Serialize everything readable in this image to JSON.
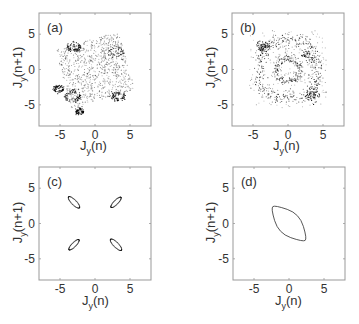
{
  "figure": {
    "xlabel_main": "J",
    "xlabel_sub": "y",
    "xlabel_arg": "(n)",
    "ylabel_main": "J",
    "ylabel_sub": "y",
    "ylabel_arg": "(n+1)",
    "tick_labels": [
      "-5",
      "0",
      "5"
    ]
  },
  "chart_data": [
    {
      "type": "scatter",
      "panel_label": "(a)",
      "title": "",
      "xlabel": "J_y(n)",
      "ylabel": "J_y(n+1)",
      "xlim": [
        -8,
        8
      ],
      "ylim": [
        -8,
        8
      ],
      "xticks": [
        -5,
        0,
        5
      ],
      "yticks": [
        -5,
        0,
        5
      ],
      "grid": false,
      "description": "Chaotic scatter filling a rotated square region roughly |x|,|y|<6.5, with denser clusters near (-3,3), (-5,-3), (-3,-3.5), (3,-4), (3,2.5)",
      "clusters": [
        {
          "x": -3.0,
          "y": 3.2,
          "spread": 0.9,
          "density": "high"
        },
        {
          "x": -5.2,
          "y": -2.8,
          "spread": 0.7,
          "density": "high"
        },
        {
          "x": -3.2,
          "y": -3.8,
          "spread": 1.0,
          "density": "high"
        },
        {
          "x": -2.2,
          "y": -6.0,
          "spread": 0.5,
          "density": "high"
        },
        {
          "x": 3.4,
          "y": -3.8,
          "spread": 0.9,
          "density": "high"
        },
        {
          "x": 3.0,
          "y": 2.5,
          "spread": 1.0,
          "density": "medium"
        },
        {
          "x": 0.0,
          "y": 0.0,
          "spread": 4.5,
          "density": "low"
        }
      ]
    },
    {
      "type": "scatter",
      "panel_label": "(b)",
      "title": "",
      "xlabel": "J_y(n)",
      "ylabel": "J_y(n+1)",
      "xlim": [
        -8,
        8
      ],
      "ylim": [
        -8,
        8
      ],
      "xticks": [
        -5,
        0,
        5
      ],
      "yticks": [
        -5,
        0,
        5
      ],
      "grid": false,
      "description": "Scatter forming an outer rotated-square ring (radius ~4.5) plus an inner ring (radius ~1.7) around the origin, denser clusters at (-3.5,3) and (3.5,-3.5)",
      "rings": [
        {
          "radius": 4.5,
          "density": "medium"
        },
        {
          "radius": 1.7,
          "density": "high"
        }
      ],
      "clusters": [
        {
          "x": -3.6,
          "y": 3.2,
          "spread": 0.7,
          "density": "high"
        },
        {
          "x": 3.6,
          "y": -3.6,
          "spread": 0.8,
          "density": "high"
        },
        {
          "x": 2.5,
          "y": 2.0,
          "spread": 0.8,
          "density": "medium"
        }
      ]
    },
    {
      "type": "scatter",
      "panel_label": "(c)",
      "title": "",
      "xlabel": "J_y(n)",
      "ylabel": "J_y(n+1)",
      "xlim": [
        -8,
        8
      ],
      "ylim": [
        -8,
        8
      ],
      "xticks": [
        -5,
        0,
        5
      ],
      "yticks": [
        -5,
        0,
        5
      ],
      "grid": false,
      "description": "Four small closed dotted islands at four quadrants",
      "islands": [
        {
          "cx": -3.0,
          "cy": 3.0,
          "rx": 1.1,
          "ry": 0.35,
          "angle": -45
        },
        {
          "cx": 3.0,
          "cy": 3.0,
          "rx": 1.0,
          "ry": 0.3,
          "angle": 45
        },
        {
          "cx": -3.0,
          "cy": -3.0,
          "rx": 1.0,
          "ry": 0.3,
          "angle": 45
        },
        {
          "cx": 3.0,
          "cy": -3.0,
          "rx": 1.1,
          "ry": 0.35,
          "angle": -45
        }
      ]
    },
    {
      "type": "line",
      "panel_label": "(d)",
      "title": "",
      "xlabel": "J_y(n)",
      "ylabel": "J_y(n+1)",
      "xlim": [
        -8,
        8
      ],
      "ylim": [
        -8,
        8
      ],
      "xticks": [
        -5,
        0,
        5
      ],
      "yticks": [
        -5,
        0,
        5
      ],
      "grid": false,
      "description": "Single closed invariant curve, rounded rhombus elongated along the y=-x diagonal",
      "curve": {
        "x": [
          -2.6,
          -2.0,
          1.5,
          2.6,
          2.0,
          -1.5,
          -2.6
        ],
        "y": [
          2.2,
          2.6,
          1.4,
          -2.2,
          -2.6,
          -1.4,
          2.2
        ]
      }
    }
  ]
}
